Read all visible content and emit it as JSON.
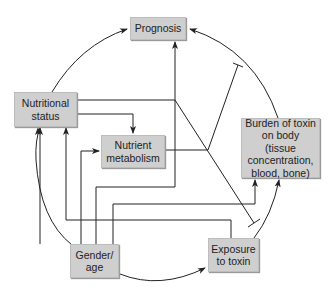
{
  "diagram": {
    "nodes": {
      "prognosis": {
        "label": "Prognosis"
      },
      "nutritional_status": {
        "label": "Nutritional status"
      },
      "nutrient_metabolism": {
        "label": "Nutrient metabolism"
      },
      "burden_of_toxin": {
        "label": "Burden of toxin on body (tissue concentration, blood, bone)"
      },
      "gender_age": {
        "label": "Gender/ age"
      },
      "exposure_to_toxin": {
        "label": "Exposure to toxin"
      }
    },
    "edges": [
      {
        "from": "Nutritional status",
        "to": "Prognosis",
        "type": "arrow"
      },
      {
        "from": "Burden of toxin on body",
        "to": "Prognosis",
        "type": "arrow"
      },
      {
        "from": "Nutritional status",
        "to": "Nutrient metabolism",
        "type": "arrow"
      },
      {
        "from": "Nutritional status",
        "to": "Exposure to toxin",
        "type": "inhibit"
      },
      {
        "from": "Nutrient metabolism",
        "to": "Burden of toxin on body",
        "type": "inhibit"
      },
      {
        "from": "Gender/age",
        "to": "Nutritional status",
        "type": "arrow"
      },
      {
        "from": "Exposure to toxin",
        "to": "Nutritional status",
        "type": "arrow"
      },
      {
        "from": "Gender/age",
        "to": "Nutrient metabolism",
        "type": "arrow"
      },
      {
        "from": "Gender/age",
        "to": "Prognosis",
        "type": "arrow"
      },
      {
        "from": "Gender/age",
        "to": "Burden of toxin on body",
        "type": "arrow"
      },
      {
        "from": "Gender/age",
        "to": "Exposure to toxin",
        "type": "arrow"
      },
      {
        "from": "Exposure to toxin",
        "to": "Burden of toxin on body",
        "type": "arrow"
      },
      {
        "from": "Gender/age",
        "to": "Nutritional status",
        "type": "arrow (outer arc)"
      }
    ],
    "colors": {
      "box_fill": "#cfcfcf",
      "line": "#222222"
    }
  }
}
